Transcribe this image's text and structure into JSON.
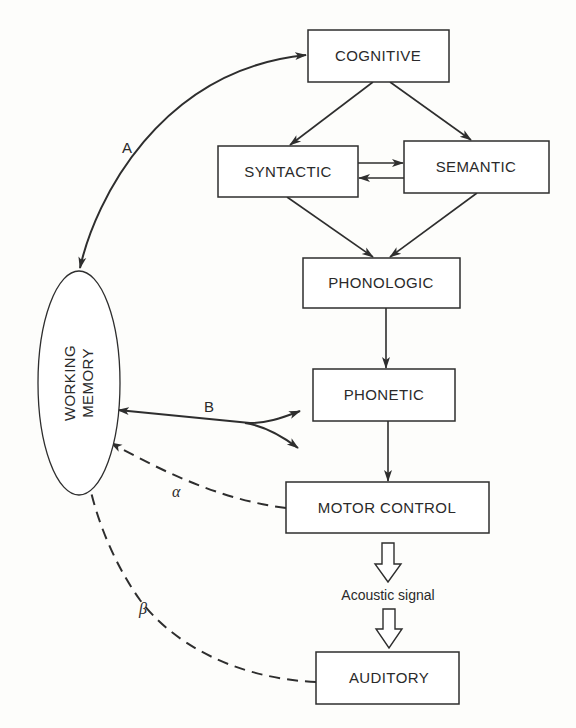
{
  "diagram": {
    "type": "flow-diagram",
    "nodes": {
      "cognitive": {
        "label": "COGNITIVE"
      },
      "syntactic": {
        "label": "SYNTACTIC"
      },
      "semantic": {
        "label": "SEMANTIC"
      },
      "phonologic": {
        "label": "PHONOLOGIC"
      },
      "phonetic": {
        "label": "PHONETIC"
      },
      "motor_control": {
        "label": "MOTOR CONTROL"
      },
      "auditory": {
        "label": "AUDITORY"
      },
      "working_memory": {
        "line1": "WORKING",
        "line2": "MEMORY"
      }
    },
    "signal": {
      "label": "Acoustic signal"
    },
    "edge_labels": {
      "a": "A",
      "b": "B",
      "alpha": "α",
      "beta": "β"
    },
    "edges": [
      {
        "from": "Working Memory",
        "to": "Cognitive",
        "label": "A",
        "style": "solid",
        "direction": "bidirectional"
      },
      {
        "from": "Cognitive",
        "to": "Syntactic",
        "style": "solid"
      },
      {
        "from": "Cognitive",
        "to": "Semantic",
        "style": "solid"
      },
      {
        "from": "Syntactic",
        "to": "Semantic",
        "style": "solid"
      },
      {
        "from": "Semantic",
        "to": "Syntactic",
        "style": "solid"
      },
      {
        "from": "Syntactic",
        "to": "Phonologic",
        "style": "solid"
      },
      {
        "from": "Semantic",
        "to": "Phonologic",
        "style": "solid"
      },
      {
        "from": "Phonologic",
        "to": "Phonetic",
        "style": "solid"
      },
      {
        "from": "Working Memory",
        "to": "Phonologic/Phonetic",
        "label": "B",
        "style": "solid",
        "direction": "bidirectional-branching"
      },
      {
        "from": "Phonetic",
        "to": "Motor Control",
        "style": "solid"
      },
      {
        "from": "Motor Control",
        "to": "Working Memory",
        "label": "α",
        "style": "dashed"
      },
      {
        "from": "Motor Control",
        "to": "Acoustic signal",
        "style": "hollow"
      },
      {
        "from": "Acoustic signal",
        "to": "Auditory",
        "style": "hollow"
      },
      {
        "from": "Auditory",
        "to": "Working Memory",
        "label": "β",
        "style": "dashed"
      }
    ]
  }
}
